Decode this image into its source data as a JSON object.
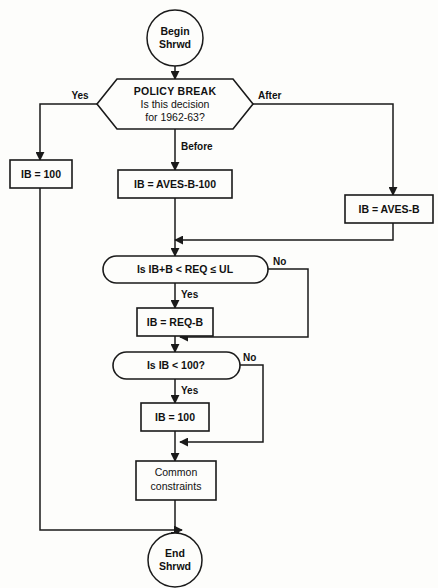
{
  "diagram": {
    "type": "flowchart",
    "colors": {
      "background": "#fdfdfb",
      "stroke": "#1a1a1a",
      "text": "#111111"
    },
    "nodes": {
      "begin": {
        "shape": "terminator-circle",
        "line1": "Begin",
        "line2": "Shrwd"
      },
      "policy_break": {
        "shape": "hexagon",
        "line1": "POLICY BREAK",
        "line2": "Is this decision",
        "line3": "for 1962-63?"
      },
      "ib_100_left": {
        "shape": "process",
        "label": "IB = 100"
      },
      "ib_aves_b_100": {
        "shape": "process",
        "label": "IB = AVES-B-100"
      },
      "ib_aves_b": {
        "shape": "process",
        "label": "IB = AVES-B"
      },
      "check_req": {
        "shape": "stadium",
        "label": "Is IB+B < REQ ≤ UL"
      },
      "ib_req_b": {
        "shape": "process",
        "label": "IB = REQ-B"
      },
      "check_ib_100": {
        "shape": "stadium",
        "label": "Is IB < 100?"
      },
      "ib_100_mid": {
        "shape": "process",
        "label": "IB = 100"
      },
      "common_constraints": {
        "shape": "process",
        "line1": "Common",
        "line2": "constraints"
      },
      "end": {
        "shape": "terminator-circle",
        "line1": "End",
        "line2": "Shrwd"
      }
    },
    "edge_labels": {
      "yes_policy": "Yes",
      "after_policy": "After",
      "before_policy": "Before",
      "no_req": "No",
      "yes_req": "Yes",
      "no_ib100": "No",
      "yes_ib100": "Yes"
    }
  }
}
